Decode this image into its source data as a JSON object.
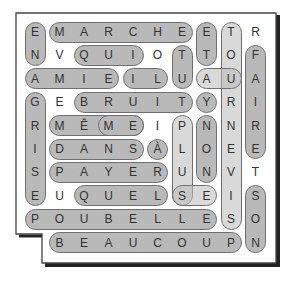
{
  "puzzle": {
    "type": "word-search",
    "grid": [
      [
        "E",
        "M",
        "A",
        "R",
        "C",
        "H",
        "E",
        "E",
        "T",
        "R"
      ],
      [
        "N",
        "V",
        "Q",
        "U",
        "I",
        "O",
        "T",
        "T",
        "O",
        "F"
      ],
      [
        "A",
        "M",
        "I",
        "E",
        "I",
        "L",
        "U",
        "A",
        "U",
        "A"
      ],
      [
        "G",
        "E",
        "B",
        "R",
        "U",
        "I",
        "T",
        "Y",
        "R",
        "I"
      ],
      [
        "R",
        "M",
        "Ê",
        "M",
        "E",
        "I",
        "P",
        "N",
        "N",
        "R"
      ],
      [
        "I",
        "D",
        "A",
        "N",
        "S",
        "À",
        "L",
        "O",
        "E",
        "E"
      ],
      [
        "S",
        "P",
        "A",
        "Y",
        "E",
        "R",
        "U",
        "N",
        "V",
        "T"
      ],
      [
        "E",
        "U",
        "Q",
        "U",
        "E",
        "L",
        "S",
        "E",
        "I",
        "S"
      ],
      [
        "P",
        "O",
        "U",
        "B",
        "E",
        "L",
        "L",
        "E",
        "S",
        "O"
      ],
      [
        "",
        "B",
        "E",
        "A",
        "U",
        "C",
        "O",
        "U",
        "P",
        "N"
      ]
    ],
    "found_words": [
      {
        "word": "EN",
        "row": 0,
        "col": 0,
        "dir": "down",
        "len": 2
      },
      {
        "word": "MARCHE",
        "row": 0,
        "col": 1,
        "dir": "across",
        "len": 6
      },
      {
        "word": "ET",
        "row": 0,
        "col": 7,
        "dir": "down",
        "len": 2
      },
      {
        "word": "TOURNEVIS",
        "row": 0,
        "col": 8,
        "dir": "down",
        "len": 9
      },
      {
        "word": "QUI",
        "row": 1,
        "col": 2,
        "dir": "across",
        "len": 3
      },
      {
        "word": "TU",
        "row": 1,
        "col": 6,
        "dir": "down",
        "len": 2
      },
      {
        "word": "FAIRE",
        "row": 1,
        "col": 9,
        "dir": "down",
        "len": 5
      },
      {
        "word": "AMIE",
        "row": 2,
        "col": 0,
        "dir": "across",
        "len": 4
      },
      {
        "word": "IL",
        "row": 2,
        "col": 4,
        "dir": "across",
        "len": 2
      },
      {
        "word": "AU",
        "row": 2,
        "col": 7,
        "dir": "across",
        "len": 2
      },
      {
        "word": "GRISE",
        "row": 3,
        "col": 0,
        "dir": "down",
        "len": 5
      },
      {
        "word": "BRUIT",
        "row": 3,
        "col": 2,
        "dir": "across",
        "len": 5
      },
      {
        "word": "Y",
        "row": 3,
        "col": 7,
        "dir": "across",
        "len": 1
      },
      {
        "word": "MÊME",
        "row": 4,
        "col": 1,
        "dir": "across",
        "len": 4
      },
      {
        "word": "ME",
        "row": 4,
        "col": 3,
        "dir": "across",
        "len": 2
      },
      {
        "word": "PLUS",
        "row": 4,
        "col": 6,
        "dir": "down",
        "len": 4
      },
      {
        "word": "NON",
        "row": 4,
        "col": 7,
        "dir": "down",
        "len": 3
      },
      {
        "word": "DANS",
        "row": 5,
        "col": 1,
        "dir": "across",
        "len": 4
      },
      {
        "word": "À",
        "row": 5,
        "col": 5,
        "dir": "across",
        "len": 1
      },
      {
        "word": "PAYER",
        "row": 6,
        "col": 1,
        "dir": "across",
        "len": 5
      },
      {
        "word": "QUEL",
        "row": 7,
        "col": 2,
        "dir": "across",
        "len": 4
      },
      {
        "word": "SE",
        "row": 7,
        "col": 6,
        "dir": "across",
        "len": 2
      },
      {
        "word": "SON",
        "row": 7,
        "col": 9,
        "dir": "down",
        "len": 3
      },
      {
        "word": "POUBELLE",
        "row": 8,
        "col": 0,
        "dir": "across",
        "len": 8
      },
      {
        "word": "BEAUCOUP",
        "row": 9,
        "col": 1,
        "dir": "across",
        "len": 8
      }
    ]
  },
  "colors": {
    "pill_fill": "#b9b9b9",
    "pill_border": "#6f6f6f",
    "letter": "#333333",
    "frame": "#333333",
    "shadow": "#222222"
  }
}
